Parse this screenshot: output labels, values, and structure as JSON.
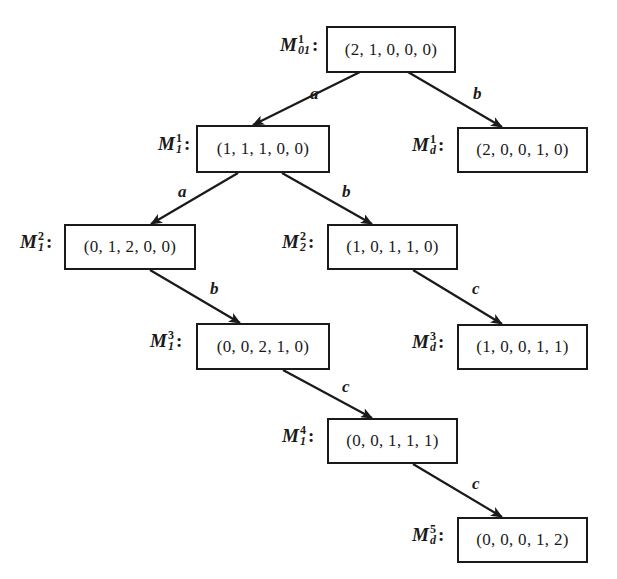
{
  "diagram": {
    "type": "reachability-tree",
    "nodes": [
      {
        "id": "M01_1",
        "symbol": "M",
        "sup": "1",
        "sub": "01",
        "marking": "(2, 1, 0, 0, 0)"
      },
      {
        "id": "M1_1",
        "symbol": "M",
        "sup": "1",
        "sub": "1",
        "marking": "(1, 1, 1, 0, 0)"
      },
      {
        "id": "Md_1",
        "symbol": "M",
        "sup": "1",
        "sub": "d",
        "marking": "(2, 0, 0, 1, 0)"
      },
      {
        "id": "M1_2",
        "symbol": "M",
        "sup": "2",
        "sub": "1",
        "marking": "(0, 1, 2, 0, 0)"
      },
      {
        "id": "M2_2",
        "symbol": "M",
        "sup": "2",
        "sub": "2",
        "marking": "(1, 0, 1, 1, 0)"
      },
      {
        "id": "M1_3",
        "symbol": "M",
        "sup": "3",
        "sub": "1",
        "marking": "(0, 0, 2, 1, 0)"
      },
      {
        "id": "Md_3",
        "symbol": "M",
        "sup": "3",
        "sub": "d",
        "marking": "(1, 0, 0, 1, 1)"
      },
      {
        "id": "M1_4",
        "symbol": "M",
        "sup": "4",
        "sub": "1",
        "marking": "(0, 0, 1, 1, 1)"
      },
      {
        "id": "Md_5",
        "symbol": "M",
        "sup": "5",
        "sub": "d",
        "marking": "(0, 0, 0, 1, 2)"
      }
    ],
    "edges": [
      {
        "from": "M01_1",
        "to": "M1_1",
        "label": "a"
      },
      {
        "from": "M01_1",
        "to": "Md_1",
        "label": "b"
      },
      {
        "from": "M1_1",
        "to": "M1_2",
        "label": "a"
      },
      {
        "from": "M1_1",
        "to": "M2_2",
        "label": "b"
      },
      {
        "from": "M1_2",
        "to": "M1_3",
        "label": "b"
      },
      {
        "from": "M2_2",
        "to": "Md_3",
        "label": "c"
      },
      {
        "from": "M1_3",
        "to": "M1_4",
        "label": "c"
      },
      {
        "from": "M1_4",
        "to": "Md_5",
        "label": "c"
      }
    ],
    "colors": {
      "stroke": "#1a1a1a",
      "background": "#ffffff"
    }
  }
}
